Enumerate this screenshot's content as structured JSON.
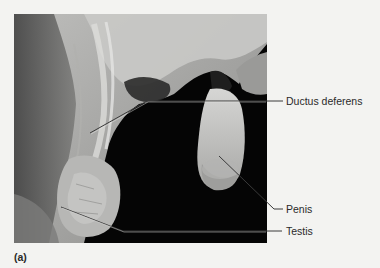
{
  "figure": {
    "panel_label": "(a)",
    "image_description": "Cadaver dissection photograph (grayscale) of male reproductive structures",
    "labels": [
      {
        "id": "ductus-deferens",
        "text": "Ductus deferens"
      },
      {
        "id": "penis",
        "text": "Penis"
      },
      {
        "id": "testis",
        "text": "Testis"
      }
    ]
  },
  "colors": {
    "background": "#f3f3f1",
    "photo_background": "#050505",
    "label_text": "#2a2a2a",
    "leader_line": "#3a3a3a"
  }
}
